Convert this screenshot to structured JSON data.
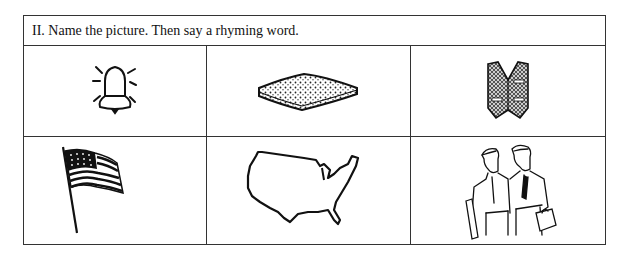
{
  "worksheet": {
    "instruction": "II.  Name the picture. Then say a rhyming word.",
    "pictures": [
      {
        "row": 1,
        "col": 1,
        "subject": "bell-icon"
      },
      {
        "row": 1,
        "col": 2,
        "subject": "sponge-icon"
      },
      {
        "row": 1,
        "col": 3,
        "subject": "vest-icon"
      },
      {
        "row": 2,
        "col": 1,
        "subject": "flag-icon"
      },
      {
        "row": 2,
        "col": 2,
        "subject": "usa-map-icon"
      },
      {
        "row": 2,
        "col": 3,
        "subject": "two-men-icon"
      }
    ]
  }
}
